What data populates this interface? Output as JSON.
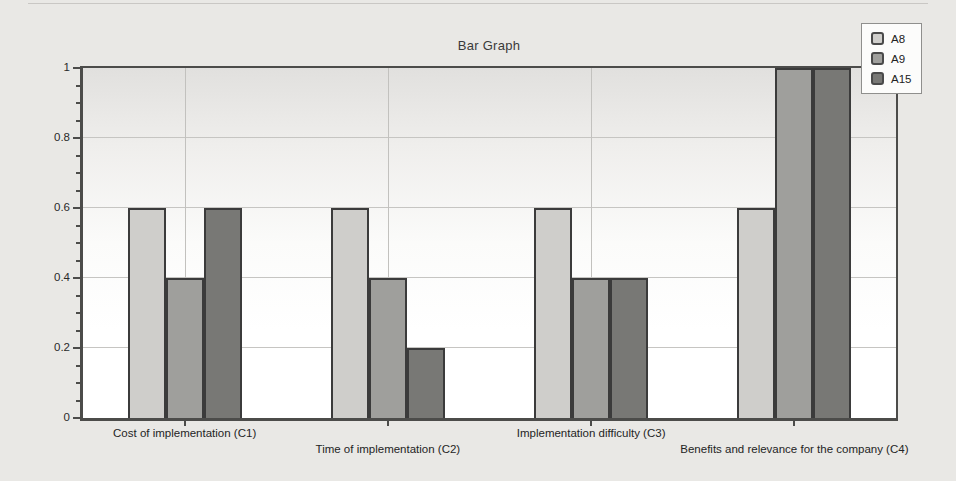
{
  "chart_data": {
    "type": "bar",
    "title": "Bar Graph",
    "categories": [
      "Cost of implementation (C1)",
      "Time of implementation (C2)",
      "Implementation difficulty (C3)",
      "Benefits and relevance for the company (C4)"
    ],
    "series": [
      {
        "name": "A8",
        "color": "#cfcecb",
        "values": [
          0.6,
          0.6,
          0.6,
          0.6
        ]
      },
      {
        "name": "A9",
        "color": "#9f9f9c",
        "values": [
          0.4,
          0.4,
          0.4,
          1.0
        ]
      },
      {
        "name": "A15",
        "color": "#787875",
        "values": [
          0.6,
          0.2,
          0.4,
          1.0
        ]
      }
    ],
    "xlabel": "",
    "ylabel": "",
    "ylim": [
      0,
      1
    ],
    "yticks": [
      0,
      0.2,
      0.4,
      0.6,
      0.8,
      1
    ],
    "ytick_labels": [
      "0",
      "0.2",
      "0.4",
      "0.6",
      "0.8",
      "1"
    ],
    "minor_tick_step": 0.05,
    "grid": true,
    "legend_position": "top-right",
    "colors": {
      "page_background": "#e9e8e5",
      "plot_gradient_top": "#e1e0de",
      "plot_gradient_bottom": "#ffffff",
      "axis": "#4c4c4a",
      "gridline": "#c6c5c2",
      "bar_border": "#3b3b3b"
    }
  }
}
